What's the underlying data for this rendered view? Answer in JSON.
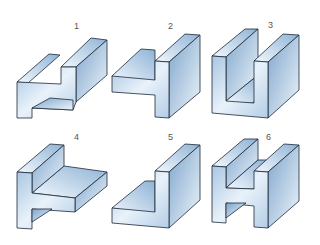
{
  "figure": {
    "colors": {
      "light": "#f2f7fc",
      "mid": "#b9d3ea",
      "dark": "#7fa6cc",
      "edge": "#1c2a38"
    },
    "shapes": [
      {
        "label": "1",
        "profile": "Z-step"
      },
      {
        "label": "2",
        "profile": "T-side"
      },
      {
        "label": "3",
        "profile": "U-channel"
      },
      {
        "label": "4",
        "profile": "T-ledge"
      },
      {
        "label": "5",
        "profile": "L-angle"
      },
      {
        "label": "6",
        "profile": "H-beam"
      }
    ]
  }
}
